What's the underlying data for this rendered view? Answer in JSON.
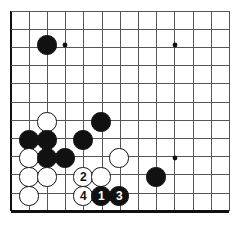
{
  "diagram": {
    "board": {
      "style": "go-goban",
      "line_color": "#555555",
      "edge_color": "#111111",
      "background_color": "#ffffff",
      "origin_x": 11,
      "origin_y": 11,
      "spacing": 18.2,
      "cols": 13,
      "rows": 12,
      "left_edge_bold": true,
      "bottom_edge_bold": true,
      "top_edge_bold": false,
      "right_edge_bold": false,
      "stone_radius": 9.6
    },
    "star_points": [
      {
        "name": "star-point-upper-left",
        "cx": 65,
        "cy": 45
      },
      {
        "name": "star-point-upper-right",
        "cx": 175,
        "cy": 45
      },
      {
        "name": "star-point-lower-right",
        "cx": 175,
        "cy": 158
      }
    ],
    "stones": [
      {
        "name": "black-stone-upper-left",
        "color": "black",
        "label": "",
        "cx": 47,
        "cy": 45
      },
      {
        "name": "black-stone-center",
        "color": "black",
        "label": "",
        "cx": 101,
        "cy": 122
      },
      {
        "name": "white-stone-a",
        "color": "white",
        "label": "",
        "cx": 47,
        "cy": 122
      },
      {
        "name": "black-stone-b",
        "color": "black",
        "label": "",
        "cx": 29,
        "cy": 140
      },
      {
        "name": "black-stone-c",
        "color": "black",
        "label": "",
        "cx": 47,
        "cy": 140
      },
      {
        "name": "black-stone-d",
        "color": "black",
        "label": "",
        "cx": 83,
        "cy": 140
      },
      {
        "name": "white-stone-e",
        "color": "white",
        "label": "",
        "cx": 29,
        "cy": 158
      },
      {
        "name": "black-stone-f",
        "color": "black",
        "label": "",
        "cx": 47,
        "cy": 158
      },
      {
        "name": "black-stone-g",
        "color": "black",
        "label": "",
        "cx": 65,
        "cy": 158
      },
      {
        "name": "white-stone-h",
        "color": "white",
        "label": "",
        "cx": 119,
        "cy": 158
      },
      {
        "name": "black-stone-lower-right",
        "color": "black",
        "label": "",
        "cx": 156,
        "cy": 177
      },
      {
        "name": "white-stone-i",
        "color": "white",
        "label": "",
        "cx": 29,
        "cy": 177
      },
      {
        "name": "white-stone-j",
        "color": "white",
        "label": "",
        "cx": 47,
        "cy": 177
      },
      {
        "name": "white-move-2",
        "color": "white",
        "label": "2",
        "cx": 83,
        "cy": 177
      },
      {
        "name": "white-stone-k",
        "color": "white",
        "label": "",
        "cx": 101,
        "cy": 177
      },
      {
        "name": "white-stone-l",
        "color": "white",
        "label": "",
        "cx": 29,
        "cy": 196
      },
      {
        "name": "white-move-4",
        "color": "white",
        "label": "4",
        "cx": 83,
        "cy": 196
      },
      {
        "name": "black-move-1",
        "color": "black",
        "label": "1",
        "cx": 101,
        "cy": 196
      },
      {
        "name": "black-move-3",
        "color": "black",
        "label": "3",
        "cx": 119,
        "cy": 196
      }
    ]
  }
}
